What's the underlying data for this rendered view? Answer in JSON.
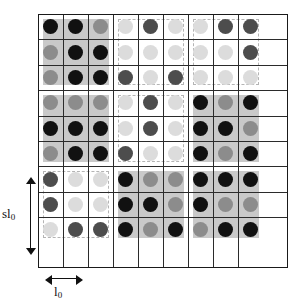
{
  "figure": {
    "name": "lattice-dot-grid-diagram",
    "background": "#ffffff",
    "frame": {
      "x": 38,
      "y": 14,
      "width": 250,
      "height": 254,
      "border_color": "#1a1a1a",
      "grid_line_color": "#2b2b2b",
      "columns": 9,
      "rows": 9,
      "cell_width": 25,
      "cell_height": 25.4
    },
    "annotations": {
      "vertical_dimension": {
        "label": "sl",
        "subscript": "0",
        "name": "sl0-dimension"
      },
      "horizontal_dimension": {
        "label": "l",
        "subscript": "0",
        "name": "l0-dimension"
      }
    }
  },
  "palette": {
    "black": "#111111",
    "dark_gray": "#4d4d4d",
    "mid_gray": "#8c8c8c",
    "light_gray": "#dcdcdc",
    "block_shade": "#c9c9c9",
    "block_dashed_border": "#b4b4b4"
  },
  "chart_data": {
    "type": "heatmap",
    "title": "",
    "xlabel": "l_0",
    "ylabel": "sl_0",
    "grid": true,
    "legend": "none",
    "x": [
      1,
      2,
      3,
      4,
      5,
      6,
      7,
      8,
      9
    ],
    "y": [
      1,
      2,
      3,
      4,
      5,
      6,
      7,
      8,
      9
    ],
    "value_levels": {
      "black": 3,
      "dark_gray": 2,
      "mid_gray": 1,
      "light_gray": 0
    },
    "rows": [
      [
        "black",
        "black",
        "mid_gray",
        "light_gray",
        "dark_gray",
        "light_gray",
        "light_gray",
        "dark_gray",
        "dark_gray"
      ],
      [
        "mid_gray",
        "black",
        "black",
        "light_gray",
        "light_gray",
        "light_gray",
        "light_gray",
        "light_gray",
        "dark_gray"
      ],
      [
        "mid_gray",
        "black",
        "black",
        "dark_gray",
        "light_gray",
        "dark_gray",
        "light_gray",
        "light_gray",
        "light_gray"
      ],
      [
        "mid_gray",
        "mid_gray",
        "mid_gray",
        "light_gray",
        "dark_gray",
        "light_gray",
        "black",
        "mid_gray",
        "black"
      ],
      [
        "black",
        "black",
        "black",
        "light_gray",
        "dark_gray",
        "light_gray",
        "black",
        "black",
        "mid_gray"
      ],
      [
        "mid_gray",
        "black",
        "black",
        "dark_gray",
        "light_gray",
        "light_gray",
        "black",
        "mid_gray",
        "black"
      ],
      [
        "dark_gray",
        "light_gray",
        "light_gray",
        "black",
        "mid_gray",
        "mid_gray",
        "black",
        "black",
        "black"
      ],
      [
        "dark_gray",
        "light_gray",
        "light_gray",
        "black",
        "black",
        "mid_gray",
        "black",
        "mid_gray",
        "mid_gray"
      ],
      [
        "light_gray",
        "dark_gray",
        "dark_gray",
        "black",
        "mid_gray",
        "black",
        "mid_gray",
        "black",
        "black"
      ]
    ],
    "blocks": [
      {
        "row_block": 0,
        "col_block": 0,
        "style": "solid"
      },
      {
        "row_block": 0,
        "col_block": 1,
        "style": "dashed"
      },
      {
        "row_block": 0,
        "col_block": 2,
        "style": "dashed"
      },
      {
        "row_block": 1,
        "col_block": 0,
        "style": "solid"
      },
      {
        "row_block": 1,
        "col_block": 1,
        "style": "dashed"
      },
      {
        "row_block": 1,
        "col_block": 2,
        "style": "solid"
      },
      {
        "row_block": 2,
        "col_block": 0,
        "style": "dashed"
      },
      {
        "row_block": 2,
        "col_block": 1,
        "style": "solid"
      },
      {
        "row_block": 2,
        "col_block": 2,
        "style": "solid"
      }
    ]
  }
}
